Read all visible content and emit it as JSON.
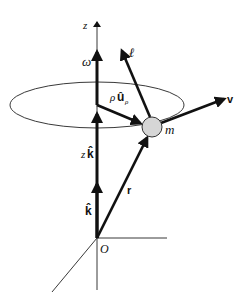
{
  "figure": {
    "colors": {
      "ink": "#111111",
      "sphere_fill": "#d6d6d6",
      "background": "#ffffff"
    },
    "labels": {
      "z_axis": "z",
      "omega": "ω",
      "ell": "ℓ",
      "rho": "ρ",
      "u_hat": "û",
      "u_sub": "ρ",
      "v": "v",
      "m": "m",
      "z": "z",
      "k_hat_scaled": "k̂",
      "k_hat": "k̂",
      "r": "r",
      "origin": "O"
    },
    "vectors": [
      {
        "name": "omega",
        "label": "ω",
        "from": [
          97,
          105
        ],
        "to": [
          97,
          50
        ]
      },
      {
        "name": "angular-momentum",
        "label": "ℓ",
        "from": [
          152,
          118
        ],
        "to": [
          121,
          48
        ]
      },
      {
        "name": "radial",
        "label": "ρû_ρ",
        "from": [
          97,
          105
        ],
        "to": [
          142,
          124
        ]
      },
      {
        "name": "velocity",
        "label": "v",
        "from": [
          162,
          123
        ],
        "to": [
          226,
          98
        ]
      },
      {
        "name": "z-k-hat",
        "label": "zk̂",
        "from": [
          97,
          238
        ],
        "to": [
          97,
          112
        ]
      },
      {
        "name": "k-hat",
        "label": "k̂",
        "from": [
          97,
          238
        ],
        "to": [
          97,
          182
        ]
      },
      {
        "name": "position",
        "label": "r",
        "from": [
          97,
          238
        ],
        "to": [
          149,
          135
        ]
      }
    ],
    "orbit": {
      "cx": 97,
      "cy": 105,
      "rx": 87,
      "ry": 23
    },
    "particle": {
      "cx": 152,
      "cy": 127,
      "r": 10,
      "label": "m"
    },
    "origin": {
      "x": 97,
      "y": 238,
      "label": "O"
    }
  }
}
